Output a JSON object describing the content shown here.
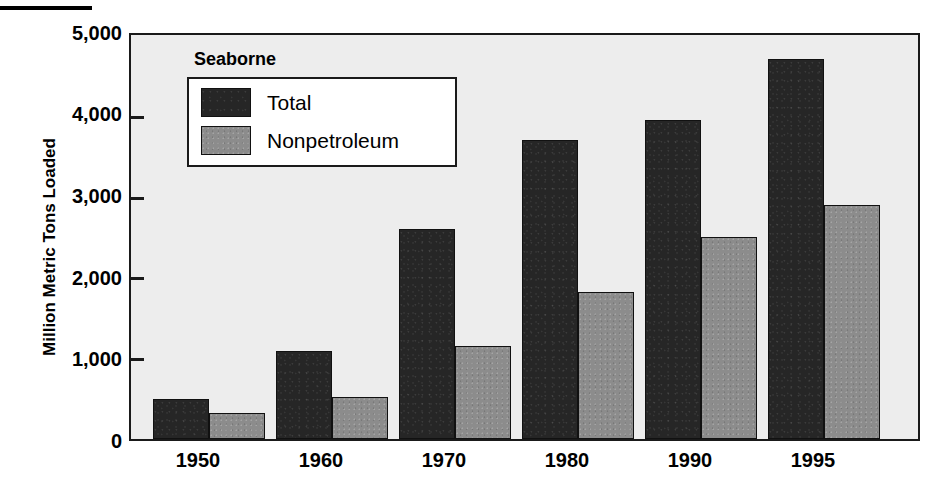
{
  "chart_data": {
    "type": "bar",
    "title": "",
    "xlabel": "",
    "ylabel": "Million Metric Tons Loaded",
    "ylim": [
      0,
      5000
    ],
    "grid": false,
    "legend_position": "upper-left-inside",
    "legend_title": "Seaborne",
    "categories": [
      "1950",
      "1960",
      "1970",
      "1980",
      "1990",
      "1995"
    ],
    "ytick_labels": [
      "0",
      "1,000",
      "2,000",
      "3,000",
      "4,000",
      "5,000"
    ],
    "ytick_values": [
      0,
      1000,
      2000,
      3000,
      4000,
      5000
    ],
    "series": [
      {
        "name": "Total",
        "color": "#262626",
        "values": [
          500,
          1090,
          2600,
          3700,
          3950,
          4700
        ]
      },
      {
        "name": "Nonpetroleum",
        "color": "#8c8c8c",
        "values": [
          320,
          520,
          1150,
          1820,
          2500,
          2900
        ]
      }
    ]
  },
  "figure": {
    "top_rule": "decorative-rule",
    "plot_background": "#ededed",
    "frame_color": "#1a1a1a"
  }
}
